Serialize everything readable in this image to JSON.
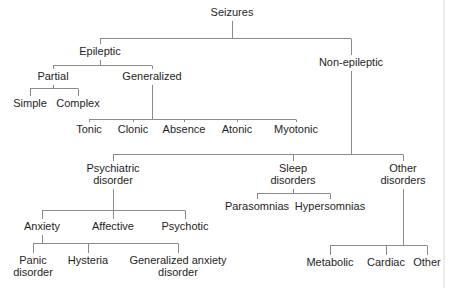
{
  "diagram": {
    "colors": {
      "line": "#8a8a8a",
      "text": "#1e1e1e"
    },
    "nodes": {
      "seizures": "Seizures",
      "epileptic": "Epileptic",
      "non_epileptic": "Non-epileptic",
      "partial": "Partial",
      "generalized": "Generalized",
      "simple": "Simple",
      "complex": "Complex",
      "tonic": "Tonic",
      "clonic": "Clonic",
      "absence": "Absence",
      "atonic": "Atonic",
      "myotonic": "Myotonic",
      "psychiatric": [
        "Psychiatric",
        "disorder"
      ],
      "sleep": [
        "Sleep",
        "disorders"
      ],
      "other_disorders": [
        "Other",
        "disorders"
      ],
      "anxiety": "Anxiety",
      "affective": "Affective",
      "psychotic": "Psychotic",
      "panic": [
        "Panic",
        "disorder"
      ],
      "hysteria": "Hysteria",
      "generalized_anxiety": [
        "Generalized anxiety",
        "disorder"
      ],
      "parasomnias": "Parasomnias",
      "hypersomnias": "Hypersomnias",
      "metabolic": "Metabolic",
      "cardiac": "Cardiac",
      "other": "Other"
    },
    "edges": [
      [
        "seizures",
        "epileptic"
      ],
      [
        "seizures",
        "non_epileptic"
      ],
      [
        "epileptic",
        "partial"
      ],
      [
        "epileptic",
        "generalized"
      ],
      [
        "partial",
        "simple"
      ],
      [
        "partial",
        "complex"
      ],
      [
        "generalized",
        "tonic"
      ],
      [
        "generalized",
        "clonic"
      ],
      [
        "generalized",
        "absence"
      ],
      [
        "generalized",
        "atonic"
      ],
      [
        "generalized",
        "myotonic"
      ],
      [
        "non_epileptic",
        "psychiatric"
      ],
      [
        "non_epileptic",
        "sleep"
      ],
      [
        "non_epileptic",
        "other_disorders"
      ],
      [
        "psychiatric",
        "anxiety"
      ],
      [
        "psychiatric",
        "affective"
      ],
      [
        "psychiatric",
        "psychotic"
      ],
      [
        "anxiety",
        "panic"
      ],
      [
        "anxiety",
        "hysteria"
      ],
      [
        "anxiety",
        "generalized_anxiety"
      ],
      [
        "sleep",
        "parasomnias"
      ],
      [
        "sleep",
        "hypersomnias"
      ],
      [
        "other_disorders",
        "metabolic"
      ],
      [
        "other_disorders",
        "cardiac"
      ],
      [
        "other_disorders",
        "other"
      ]
    ]
  }
}
